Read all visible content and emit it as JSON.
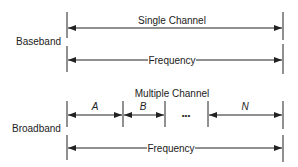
{
  "baseband": {
    "label": "Baseband",
    "channel_label": "Single Channel",
    "frequency_label": "Frequency"
  },
  "broadband": {
    "label": "Broadband",
    "channel_label": "Multiple Channel",
    "channels": [
      "A",
      "B",
      "N"
    ],
    "ellipsis": "•••",
    "frequency_label": "Frequency"
  },
  "colors": {
    "line": "#222222",
    "background": "#ffffff"
  }
}
